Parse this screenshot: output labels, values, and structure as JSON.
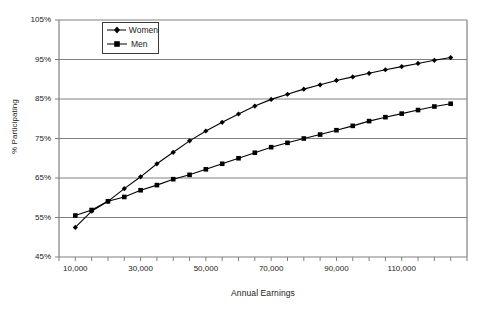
{
  "chart_data": {
    "type": "line",
    "title": "",
    "xlabel": "Annual Earnings",
    "ylabel": "% Participating",
    "xlim": [
      5000,
      130000
    ],
    "ylim": [
      45,
      105
    ],
    "y_tick_labels": [
      "45%",
      "55%",
      "65%",
      "75%",
      "85%",
      "95%",
      "105%"
    ],
    "y_tick_values": [
      45,
      55,
      65,
      75,
      85,
      95,
      105
    ],
    "x_tick_labels": [
      "10,000",
      "30,000",
      "50,000",
      "70,000",
      "90,000",
      "110,000"
    ],
    "x_tick_values": [
      10000,
      30000,
      50000,
      70000,
      90000,
      110000
    ],
    "x_minor_step": 5000,
    "grid": "horizontal",
    "legend_position": "top-left",
    "x": [
      10000,
      15000,
      20000,
      25000,
      30000,
      35000,
      40000,
      45000,
      50000,
      55000,
      60000,
      65000,
      70000,
      75000,
      80000,
      85000,
      90000,
      95000,
      100000,
      105000,
      110000,
      115000,
      120000,
      125000
    ],
    "series": [
      {
        "name": "Women",
        "marker": "diamond",
        "color": "#000000",
        "values": [
          52.5,
          56.6,
          59.1,
          62.3,
          65.3,
          68.6,
          71.5,
          74.4,
          76.9,
          79.1,
          81.2,
          83.2,
          84.9,
          86.2,
          87.5,
          88.6,
          89.7,
          90.6,
          91.5,
          92.4,
          93.2,
          94.0,
          94.8,
          95.5
        ]
      },
      {
        "name": "Men",
        "marker": "square",
        "color": "#000000",
        "values": [
          55.5,
          56.9,
          59.1,
          60.2,
          61.9,
          63.2,
          64.7,
          65.8,
          67.2,
          68.6,
          70.0,
          71.4,
          72.8,
          73.9,
          75.0,
          76.0,
          77.1,
          78.2,
          79.4,
          80.4,
          81.3,
          82.2,
          83.1,
          83.8
        ]
      }
    ]
  },
  "legend": {
    "items": [
      {
        "label": "Women"
      },
      {
        "label": "Men"
      }
    ]
  },
  "axes": {
    "y_title": "% Participating",
    "x_title": "Annual Earnings"
  }
}
